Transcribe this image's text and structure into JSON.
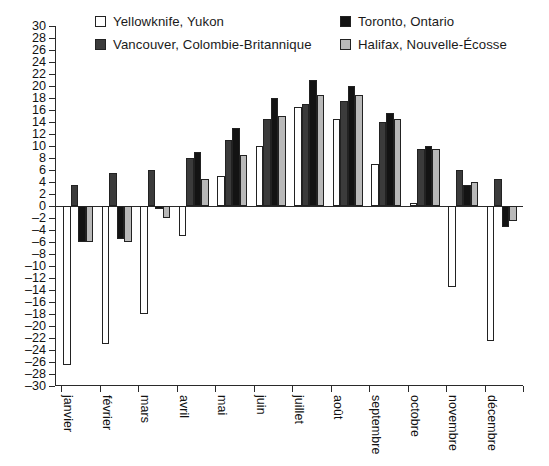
{
  "chart_data": {
    "type": "bar",
    "title": "",
    "subtitle": "",
    "xlabel": "",
    "ylabel": "",
    "ylim": [
      -30,
      30
    ],
    "ytick_step": 2,
    "grid": false,
    "legend_position": "top",
    "categories": [
      "janvier",
      "février",
      "mars",
      "avril",
      "mai",
      "juin",
      "juillet",
      "août",
      "septembre",
      "octobre",
      "novembre",
      "décembre"
    ],
    "ytick_labels": [
      "30",
      "28",
      "26",
      "24",
      "22",
      "20",
      "18",
      "16",
      "14",
      "12",
      "10",
      "8",
      "6",
      "4",
      "2",
      "0",
      "–2",
      "–4",
      "–6",
      "–8",
      "–10",
      "–12",
      "–14",
      "–16",
      "–18",
      "–20",
      "–22",
      "–24",
      "–26",
      "–28",
      "–30"
    ],
    "ytick_values": [
      30,
      28,
      26,
      24,
      22,
      20,
      18,
      16,
      14,
      12,
      10,
      8,
      6,
      4,
      2,
      0,
      -2,
      -4,
      -6,
      -8,
      -10,
      -12,
      -14,
      -16,
      -18,
      -20,
      -22,
      -24,
      -26,
      -28,
      -30
    ],
    "series": [
      {
        "name": "Yellowknife, Yukon",
        "color": "#ffffff",
        "values": [
          -26.5,
          -23.0,
          -18.0,
          -5.0,
          5.0,
          10.0,
          16.5,
          14.5,
          7.0,
          0.5,
          -13.5,
          -22.5
        ]
      },
      {
        "name": "Vancouver, Colombie-Britannique",
        "color": "#3b3b3b",
        "values": [
          3.5,
          5.5,
          6.0,
          8.0,
          11.0,
          14.5,
          17.0,
          17.5,
          14.0,
          9.5,
          6.0,
          4.5
        ]
      },
      {
        "name": "Toronto, Ontario",
        "color": "#131313",
        "values": [
          -6.0,
          -5.5,
          -0.5,
          9.0,
          13.0,
          18.0,
          21.0,
          20.0,
          15.5,
          10.0,
          3.5,
          -3.5
        ]
      },
      {
        "name": "Halifax, Nouvelle-Écosse",
        "color": "#b9b9b9",
        "values": [
          -6.0,
          -6.0,
          -2.0,
          4.5,
          8.5,
          15.0,
          18.5,
          18.5,
          14.5,
          9.5,
          4.0,
          -2.5
        ]
      }
    ]
  },
  "legend": {
    "items": [
      {
        "label": "Yellowknife, Yukon",
        "swatch": "#ffffff"
      },
      {
        "label": "Vancouver, Colombie-Britannique",
        "swatch": "#3b3b3b"
      },
      {
        "label": "Toronto, Ontario",
        "swatch": "#131313"
      },
      {
        "label": "Halifax, Nouvelle-Écosse",
        "swatch": "#b9b9b9"
      }
    ]
  }
}
